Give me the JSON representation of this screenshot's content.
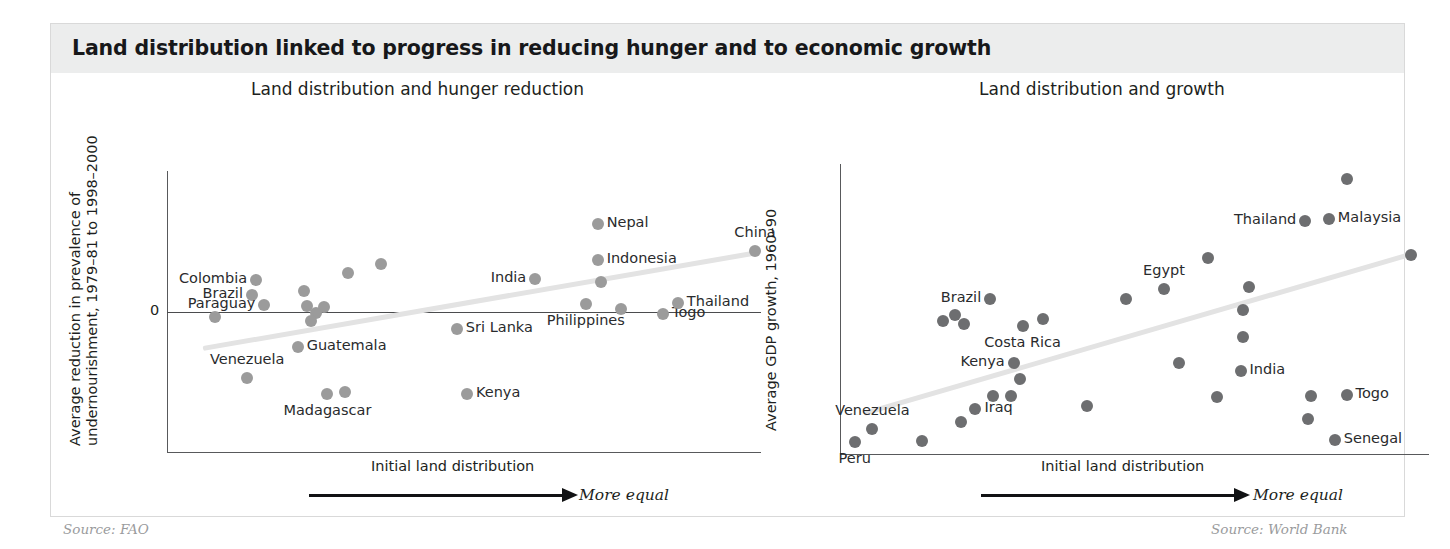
{
  "figure": {
    "title": "Land distribution linked to progress in reducing hunger and to economic growth",
    "accent_band_color": "#eceded",
    "dot_color_left": "#9b9b9b",
    "dot_color_right": "#6d6e70",
    "trend_color": "#e3e3e3"
  },
  "chart_data": [
    {
      "type": "scatter",
      "title": "Land distribution and hunger reduction",
      "xlabel": "Initial land distribution",
      "ylabel": "Average reduction in prevalence of undernourishment, 1979–81 to 1998–2000",
      "axis_note": "More equal",
      "source": "Source: FAO",
      "grid": false,
      "legend": "none",
      "ytick_labels": [
        "0"
      ],
      "xlim": [
        0,
        100
      ],
      "ylim": [
        -100,
        100
      ],
      "trendline": {
        "x0": 6,
        "y0": -26,
        "x1": 99,
        "y1": 42
      },
      "points": [
        {
          "label": "Colombia",
          "x": 15.0,
          "y": 22.5,
          "label_pos": "left"
        },
        {
          "label": "Brazil",
          "x": 14.3,
          "y": 12.0,
          "label_pos": "left"
        },
        {
          "label": "Paraguay",
          "x": 16.4,
          "y": 4.5,
          "label_pos": "left"
        },
        {
          "label": "",
          "x": 8.0,
          "y": -4.0,
          "label_pos": "none"
        },
        {
          "label": "",
          "x": 23.1,
          "y": 14.5,
          "label_pos": "none"
        },
        {
          "label": "",
          "x": 23.5,
          "y": 4.0,
          "label_pos": "none"
        },
        {
          "label": "",
          "x": 26.5,
          "y": 3.5,
          "label_pos": "none"
        },
        {
          "label": "",
          "x": 25.0,
          "y": -1.0,
          "label_pos": "none"
        },
        {
          "label": "",
          "x": 24.2,
          "y": -6.5,
          "label_pos": "none"
        },
        {
          "label": "",
          "x": 30.5,
          "y": 27.5,
          "label_pos": "none"
        },
        {
          "label": "",
          "x": 36.0,
          "y": 34.0,
          "label_pos": "none"
        },
        {
          "label": "Guatemala",
          "x": 22.0,
          "y": -25.0,
          "label_pos": "right"
        },
        {
          "label": "Venezuela",
          "x": 13.5,
          "y": -47.0,
          "label_pos": "above"
        },
        {
          "label": "Madagascar",
          "x": 27.0,
          "y": -59.0,
          "label_pos": "below"
        },
        {
          "label": "",
          "x": 30.0,
          "y": -57.0,
          "label_pos": "none"
        },
        {
          "label": "Kenya",
          "x": 50.5,
          "y": -59.0,
          "label_pos": "right"
        },
        {
          "label": "Sri Lanka",
          "x": 48.8,
          "y": -12.5,
          "label_pos": "right"
        },
        {
          "label": "India",
          "x": 62.0,
          "y": 23.0,
          "label_pos": "left"
        },
        {
          "label": "Nepal",
          "x": 72.5,
          "y": 62.0,
          "label_pos": "right"
        },
        {
          "label": "Indonesia",
          "x": 72.5,
          "y": 36.5,
          "label_pos": "right"
        },
        {
          "label": "",
          "x": 73.0,
          "y": 21.0,
          "label_pos": "none"
        },
        {
          "label": "Philippines",
          "x": 70.5,
          "y": 5.5,
          "label_pos": "below"
        },
        {
          "label": "",
          "x": 76.5,
          "y": 2.0,
          "label_pos": "none"
        },
        {
          "label": "Togo",
          "x": 83.5,
          "y": -2.0,
          "label_pos": "right"
        },
        {
          "label": "Thailand",
          "x": 86.0,
          "y": 6.0,
          "label_pos": "right"
        },
        {
          "label": "China",
          "x": 99.0,
          "y": 43.0,
          "label_pos": "above"
        }
      ]
    },
    {
      "type": "scatter",
      "title": "Land distribution and growth",
      "xlabel": "Initial land distribution",
      "ylabel": "Average GDP growth, 1960–90",
      "axis_note": "More equal",
      "source": "Source: World Bank",
      "grid": false,
      "legend": "none",
      "ytick_labels": [],
      "xlim": [
        0,
        100
      ],
      "ylim": [
        0,
        100
      ],
      "trendline": {
        "x0": 4,
        "y0": 14,
        "x1": 97,
        "y1": 69
      },
      "points": [
        {
          "label": "Peru",
          "x": 2.5,
          "y": 4.0,
          "label_pos": "below"
        },
        {
          "label": "Venezuela",
          "x": 5.5,
          "y": 8.5,
          "label_pos": "above"
        },
        {
          "label": "",
          "x": 14.0,
          "y": 4.5,
          "label_pos": "none"
        },
        {
          "label": "",
          "x": 20.5,
          "y": 11.0,
          "label_pos": "none"
        },
        {
          "label": "Iraq",
          "x": 23.0,
          "y": 15.5,
          "label_pos": "right"
        },
        {
          "label": "",
          "x": 26.0,
          "y": 20.0,
          "label_pos": "none"
        },
        {
          "label": "",
          "x": 29.0,
          "y": 20.0,
          "label_pos": "none"
        },
        {
          "label": "Kenya",
          "x": 29.5,
          "y": 31.5,
          "label_pos": "left"
        },
        {
          "label": "",
          "x": 30.5,
          "y": 26.0,
          "label_pos": "none"
        },
        {
          "label": "Costa Rica",
          "x": 31.0,
          "y": 44.0,
          "label_pos": "below"
        },
        {
          "label": "Brazil",
          "x": 25.5,
          "y": 53.5,
          "label_pos": "left"
        },
        {
          "label": "",
          "x": 17.5,
          "y": 46.0,
          "label_pos": "none"
        },
        {
          "label": "",
          "x": 19.5,
          "y": 48.0,
          "label_pos": "none"
        },
        {
          "label": "",
          "x": 21.0,
          "y": 45.0,
          "label_pos": "none"
        },
        {
          "label": "",
          "x": 34.5,
          "y": 46.5,
          "label_pos": "none"
        },
        {
          "label": "",
          "x": 42.0,
          "y": 16.5,
          "label_pos": "none"
        },
        {
          "label": "",
          "x": 48.5,
          "y": 53.5,
          "label_pos": "none"
        },
        {
          "label": "Egypt",
          "x": 55.0,
          "y": 57.0,
          "label_pos": "above"
        },
        {
          "label": "",
          "x": 62.5,
          "y": 67.5,
          "label_pos": "none"
        },
        {
          "label": "",
          "x": 57.5,
          "y": 31.5,
          "label_pos": "none"
        },
        {
          "label": "",
          "x": 64.0,
          "y": 19.5,
          "label_pos": "none"
        },
        {
          "label": "",
          "x": 68.5,
          "y": 40.5,
          "label_pos": "none"
        },
        {
          "label": "India",
          "x": 68.0,
          "y": 28.5,
          "label_pos": "right"
        },
        {
          "label": "",
          "x": 69.5,
          "y": 57.5,
          "label_pos": "none"
        },
        {
          "label": "",
          "x": 68.5,
          "y": 49.5,
          "label_pos": "none"
        },
        {
          "label": "Thailand",
          "x": 79.0,
          "y": 80.5,
          "label_pos": "left"
        },
        {
          "label": "Malaysia",
          "x": 83.0,
          "y": 81.0,
          "label_pos": "right"
        },
        {
          "label": "",
          "x": 86.0,
          "y": 95.0,
          "label_pos": "none"
        },
        {
          "label": "",
          "x": 80.0,
          "y": 20.0,
          "label_pos": "none"
        },
        {
          "label": "Togo",
          "x": 86.0,
          "y": 20.5,
          "label_pos": "right"
        },
        {
          "label": "",
          "x": 79.5,
          "y": 12.0,
          "label_pos": "none"
        },
        {
          "label": "Senegal",
          "x": 84.0,
          "y": 5.0,
          "label_pos": "right"
        },
        {
          "label": "",
          "x": 97.0,
          "y": 68.5,
          "label_pos": "none"
        }
      ]
    }
  ]
}
